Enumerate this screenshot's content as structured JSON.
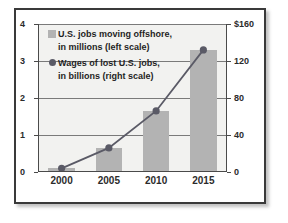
{
  "chart_data": {
    "type": "bar",
    "title": "",
    "subtitle": "",
    "xlabel": "",
    "categories": [
      "2000",
      "2005",
      "2010",
      "2015"
    ],
    "grid": true,
    "legend_position": "top-left-inside",
    "axes": {
      "left": {
        "label": "U.S. jobs moving offshore, in millions",
        "ylim": [
          0,
          4
        ],
        "ticks": [
          0,
          1,
          2,
          3,
          4
        ],
        "tick_labels": [
          "0",
          "1",
          "2",
          "3",
          "4"
        ]
      },
      "right": {
        "label": "Wages of lost U.S. jobs, in billions",
        "ylim": [
          0,
          160
        ],
        "ticks": [
          0,
          40,
          80,
          120,
          160
        ],
        "tick_labels": [
          "0",
          "40",
          "80",
          "120",
          "$160"
        ]
      }
    },
    "series": [
      {
        "name": "U.S. jobs moving offshore, in millions (left scale)",
        "type": "bar",
        "axis": "left",
        "color": "#b3b3b3",
        "values": [
          0.1,
          0.65,
          1.65,
          3.3
        ]
      },
      {
        "name": "Wages of lost U.S. jobs, in billions (right scale)",
        "type": "line",
        "axis": "right",
        "color": "#5a5a66",
        "marker": "circle",
        "values": [
          4,
          26,
          66,
          132
        ]
      }
    ],
    "legend": [
      {
        "marker": "square-swatch",
        "color": "#b3b3b3",
        "line1": "U.S. jobs moving offshore,",
        "line2": "in millions (left scale)"
      },
      {
        "marker": "circle-marker",
        "color": "#5a5a66",
        "line1": "Wages of lost U.S. jobs,",
        "line2": "in billions (right scale)"
      }
    ]
  },
  "colors": {
    "bar": "#b3b3b3",
    "line": "#5a5a66",
    "plot_background": "#f2f2f0",
    "frame_border": "#3a3a3a",
    "gridline": "#7a7a7a",
    "text": "#2b2b2b"
  }
}
